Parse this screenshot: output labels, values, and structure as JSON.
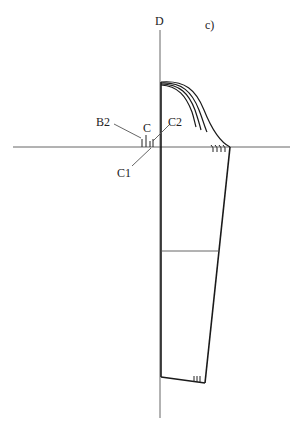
{
  "figure": {
    "panel_label": "c)",
    "axis_label": "D",
    "labels": {
      "b2": "B2",
      "c": "C",
      "c1": "C1",
      "c2": "C2"
    },
    "colors": {
      "line": "#1a1a1a",
      "guide": "#555555",
      "background": "#ffffff"
    }
  }
}
